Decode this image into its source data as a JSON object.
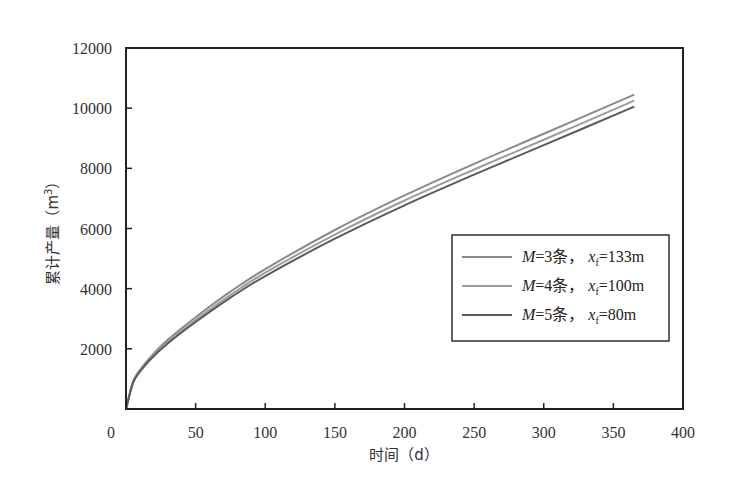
{
  "chart_data": {
    "type": "line",
    "title": "",
    "xlabel": "时间（d）",
    "ylabel": "累计产量（m³）",
    "xlim": [
      0,
      400
    ],
    "ylim": [
      0,
      12000
    ],
    "x_ticks": [
      0,
      50,
      100,
      150,
      200,
      250,
      300,
      350,
      400
    ],
    "y_ticks": [
      2000,
      4000,
      6000,
      8000,
      10000,
      12000
    ],
    "x_tick_labels": [
      "0",
      "50",
      "100",
      "150",
      "200",
      "250",
      "300",
      "350",
      "400"
    ],
    "y_tick_labels": [
      "2000",
      "4000",
      "6000",
      "8000",
      "10000",
      "12000"
    ],
    "grid": false,
    "legend_position": "center-right",
    "x": [
      0,
      5,
      10,
      20,
      30,
      50,
      75,
      100,
      150,
      200,
      250,
      300,
      365
    ],
    "series": [
      {
        "name": "M=3条，xf=133m",
        "color": "#8a8a8a",
        "values": [
          0,
          900,
          1300,
          1850,
          2300,
          3050,
          3900,
          4650,
          5950,
          7100,
          8150,
          9150,
          10450
        ]
      },
      {
        "name": "M=4条，xf=100m",
        "color": "#9c9c9c",
        "values": [
          0,
          880,
          1270,
          1800,
          2230,
          2960,
          3790,
          4530,
          5800,
          6930,
          7960,
          8950,
          10250
        ]
      },
      {
        "name": "M=5条，xf=80m",
        "color": "#5a5a5a",
        "values": [
          0,
          860,
          1240,
          1760,
          2180,
          2890,
          3700,
          4420,
          5660,
          6770,
          7790,
          8770,
          10050
        ]
      }
    ]
  },
  "legend": {
    "items": [
      {
        "M_label": "M",
        "M_value": "=3条，",
        "x_label": "x",
        "x_sub": "f",
        "x_value": "=133m"
      },
      {
        "M_label": "M",
        "M_value": "=4条，",
        "x_label": "x",
        "x_sub": "f",
        "x_value": "=100m"
      },
      {
        "M_label": "M",
        "M_value": "=5条，",
        "x_label": "x",
        "x_sub": "f",
        "x_value": "=80m"
      }
    ]
  },
  "axes": {
    "x_title": "时间（d）",
    "y_title_main": "累计产量（m",
    "y_title_sup": "3",
    "y_title_end": "）",
    "x_zero_label": "0"
  }
}
